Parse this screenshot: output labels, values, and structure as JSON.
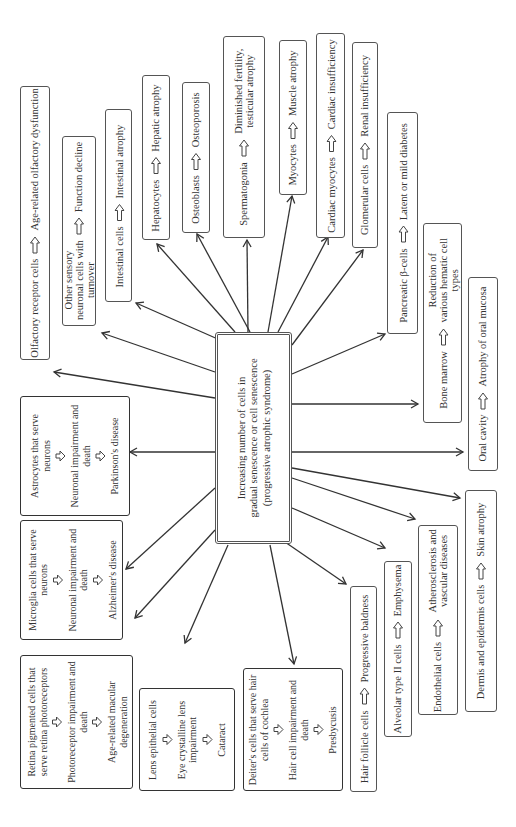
{
  "center": {
    "line1": "Increasing number of cells in",
    "line2": "gradual senescence or cell senescence",
    "line3": "(progressive atrophic syndrome)"
  },
  "arrow_icon": "hollow-right-arrow",
  "right_side_boxes": [
    {
      "id": "olfactory",
      "cell": "Olfactory receptor cells",
      "outcome": "Age-related olfactory dysfunction"
    },
    {
      "id": "sensory",
      "cell": "Other sensory neuronal cells with turnover",
      "outcome": "Function decline"
    },
    {
      "id": "intestinal",
      "cell": "Intestinal cells",
      "outcome": "Intestinal atrophy"
    },
    {
      "id": "hepatocytes",
      "cell": "Hepatocytes",
      "outcome": "Hepatic atrophy"
    },
    {
      "id": "osteoblasts",
      "cell": "Osteoblasts",
      "outcome": "Osteoporosis"
    },
    {
      "id": "spermatogonia",
      "cell": "Spermatogonia",
      "outcome": "Diminished fertility, testicular atrophy"
    },
    {
      "id": "myocytes",
      "cell": "Myocytes",
      "outcome": "Muscle atrophy"
    },
    {
      "id": "cardiac",
      "cell": "Cardiac myocytes",
      "outcome": "Cardiac insufficiency"
    },
    {
      "id": "glomerular",
      "cell": "Glomerular cells",
      "outcome": "Renal insufficiency"
    },
    {
      "id": "pancreatic",
      "cell": "Pancreatic β-cells",
      "outcome": "Latent or mild diabetes"
    },
    {
      "id": "bonemarrow",
      "cell": "Bone marrow",
      "outcome": "Reduction of various hematic cell types"
    },
    {
      "id": "oral",
      "cell": "Oral cavity",
      "outcome": "Atrophy of oral mucosa"
    },
    {
      "id": "dermis",
      "cell": "Dermis and epidermis cells",
      "outcome": "Skin atrophy"
    },
    {
      "id": "endothelial",
      "cell": "Endothelial cells",
      "outcome": "Atherosclerosis and vascular diseases"
    },
    {
      "id": "alveolar",
      "cell": "Alveolar type II cells",
      "outcome": "Emphysema"
    },
    {
      "id": "hair",
      "cell": "Hair follicle cells",
      "outcome": "Progressive baldness"
    }
  ],
  "left_side_boxes": [
    {
      "id": "astrocytes",
      "steps": [
        "Astrocytes that serve neurons",
        "Neuronal impairment and death",
        "Parkinson's disease"
      ]
    },
    {
      "id": "microglia",
      "steps": [
        "Microglia cells that serve neurons",
        "Neuronal impairment and death",
        "Alzheimer's disease"
      ]
    },
    {
      "id": "retina",
      "steps": [
        "Retina pigmented cells that serve retina photoreceptors",
        "Photoreceptor impairment and death",
        "Age-related macular degeneration"
      ]
    },
    {
      "id": "lens",
      "steps": [
        "Lens epithelial cells",
        "Eye crystalline lens impairment",
        "Cataract"
      ]
    },
    {
      "id": "deiter",
      "steps": [
        "Deiter's cells that serve hair cells of cochlea",
        "Hair cell impairment and death",
        "Presbycusis"
      ]
    }
  ]
}
